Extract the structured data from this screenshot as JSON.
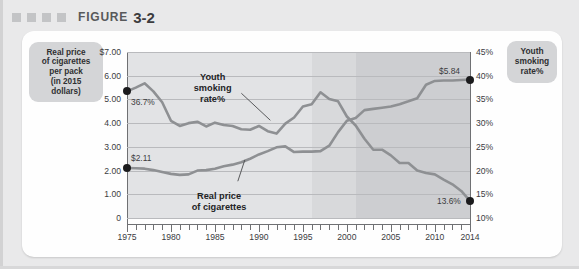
{
  "figure": {
    "label": "FIGURE",
    "number": "3-2",
    "marker_squares": 4
  },
  "chips": {
    "left": [
      "Real price",
      "of cigarettes",
      "per pack",
      "(in 2015",
      "dollars)"
    ],
    "right": [
      "Youth",
      "smoking",
      "rate%"
    ]
  },
  "inline_labels": {
    "youth": [
      "Youth",
      "smoking",
      "rate%"
    ],
    "price": [
      "Real price",
      "of cigarettes"
    ]
  },
  "annotations": {
    "youth_start": "36.7%",
    "youth_end": "13.6%",
    "price_start": "$2.11",
    "price_end": "$5.84"
  },
  "chart_data": {
    "type": "line",
    "title": "FIGURE 3-2",
    "xlabel": "",
    "ylabel": "Real price of cigarettes per pack (in 2015 dollars)",
    "y2label": "Youth smoking rate%",
    "grid": true,
    "legend": "inline-annotations",
    "xlim": [
      1975,
      2014
    ],
    "ylim": [
      0,
      7
    ],
    "y2lim": [
      10,
      45
    ],
    "xticks": [
      1975,
      1980,
      1985,
      1990,
      1995,
      2000,
      2005,
      2010,
      2014
    ],
    "xticklabels": [
      "1975",
      "1980",
      "1985",
      "1990",
      "1995",
      "2000",
      "2005",
      "2010",
      "2014"
    ],
    "yticks": [
      0,
      1,
      2,
      3,
      4,
      5,
      6,
      7
    ],
    "yticklabels": [
      "0",
      "1.00",
      "2.00",
      "3.00",
      "4.00",
      "5.00",
      "6.00",
      "$7.00"
    ],
    "y2ticks": [
      10,
      15,
      20,
      25,
      30,
      35,
      40,
      45
    ],
    "y2ticklabels": [
      "10%",
      "15%",
      "20%",
      "25%",
      "30%",
      "35%",
      "40%",
      "45%"
    ],
    "shaded_bands": [
      {
        "from": 1975,
        "to": 1996,
        "shade": "#e2e3e5"
      },
      {
        "from": 1996,
        "to": 2001,
        "shade": "#d8d9db"
      },
      {
        "from": 2001,
        "to": 2014,
        "shade": "#cdced1"
      }
    ],
    "series": [
      {
        "name": "Real price of cigarettes",
        "axis": "left",
        "color": "#8e9093",
        "x": [
          1975,
          1976,
          1977,
          1978,
          1979,
          1980,
          1981,
          1982,
          1983,
          1984,
          1985,
          1986,
          1987,
          1988,
          1989,
          1990,
          1991,
          1992,
          1993,
          1994,
          1995,
          1996,
          1997,
          1998,
          1999,
          2000,
          2001,
          2002,
          2003,
          2004,
          2005,
          2006,
          2007,
          2008,
          2009,
          2010,
          2011,
          2012,
          2013,
          2014
        ],
        "y": [
          2.11,
          2.1,
          2.08,
          2.02,
          1.94,
          1.86,
          1.82,
          1.84,
          2.0,
          2.02,
          2.08,
          2.18,
          2.25,
          2.35,
          2.5,
          2.68,
          2.82,
          2.98,
          3.02,
          2.78,
          2.8,
          2.8,
          2.82,
          3.05,
          3.62,
          4.1,
          4.22,
          4.55,
          4.6,
          4.65,
          4.7,
          4.8,
          4.92,
          5.05,
          5.62,
          5.78,
          5.8,
          5.8,
          5.82,
          5.84
        ],
        "start_label": "$2.11",
        "end_label": "$5.84"
      },
      {
        "name": "Youth smoking rate%",
        "axis": "right",
        "color": "#8e9093",
        "x": [
          1975,
          1976,
          1977,
          1978,
          1979,
          1980,
          1981,
          1982,
          1983,
          1984,
          1985,
          1986,
          1987,
          1988,
          1989,
          1990,
          1991,
          1992,
          1993,
          1994,
          1995,
          1996,
          1997,
          1998,
          1999,
          2000,
          2001,
          2002,
          2003,
          2004,
          2005,
          2006,
          2007,
          2008,
          2009,
          2010,
          2011,
          2012,
          2013,
          2014
        ],
        "y": [
          36.7,
          37.5,
          38.4,
          36.7,
          34.4,
          30.5,
          29.4,
          30.0,
          30.3,
          29.3,
          30.1,
          29.6,
          29.4,
          28.7,
          28.6,
          29.4,
          28.3,
          27.8,
          29.9,
          31.2,
          33.5,
          34.0,
          36.5,
          35.1,
          34.6,
          31.4,
          29.5,
          26.7,
          24.4,
          24.4,
          23.2,
          21.6,
          21.6,
          20.0,
          19.5,
          19.2,
          18.1,
          17.1,
          15.7,
          13.6
        ],
        "start_label": "36.7%",
        "end_label": "13.6%"
      }
    ]
  }
}
